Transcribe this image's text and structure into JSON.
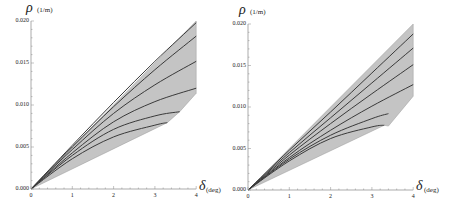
{
  "chart_data": [
    {
      "type": "area",
      "title": "",
      "xlabel": "δ (deg)",
      "ylabel": "ρ (1/m)",
      "x_symbol": "δ",
      "x_unit": "(deg)",
      "y_symbol": "ρ",
      "y_unit": "(1/m)",
      "xlim": [
        0,
        4
      ],
      "ylim": [
        0,
        0.02
      ],
      "xticks": [
        "0",
        "1",
        "2",
        "3",
        "4"
      ],
      "yticks": [
        "0.000",
        "0.005",
        "0.010",
        "0.015",
        "0.020"
      ],
      "grid": false,
      "fill_color": "#c4c4c4",
      "line_color": "#3a3a3a",
      "region_boundary": [
        [
          0,
          0
        ],
        [
          4,
          0.02
        ],
        [
          4,
          0.0114
        ],
        [
          3.6,
          0.0092
        ],
        [
          3.3,
          0.0079
        ],
        [
          0,
          0
        ]
      ],
      "series": [
        {
          "name": "curve-1",
          "x": [
            0,
            1,
            2,
            3,
            4
          ],
          "y": [
            0,
            0.0052,
            0.0103,
            0.0152,
            0.0198
          ]
        },
        {
          "name": "curve-2",
          "x": [
            0,
            1,
            2,
            3,
            4
          ],
          "y": [
            0,
            0.005,
            0.0098,
            0.0142,
            0.0182
          ]
        },
        {
          "name": "curve-3",
          "x": [
            0,
            1,
            2,
            3,
            4
          ],
          "y": [
            0,
            0.0047,
            0.009,
            0.0124,
            0.0152
          ]
        },
        {
          "name": "curve-4",
          "x": [
            0,
            1,
            2,
            3,
            4
          ],
          "y": [
            0,
            0.0043,
            0.008,
            0.0104,
            0.012
          ]
        },
        {
          "name": "curve-5",
          "x": [
            0,
            1,
            2,
            3,
            3.6
          ],
          "y": [
            0,
            0.004,
            0.0071,
            0.0087,
            0.0092
          ]
        },
        {
          "name": "curve-6",
          "x": [
            0,
            1,
            2,
            3,
            3.3
          ],
          "y": [
            0,
            0.0036,
            0.0062,
            0.0076,
            0.0079
          ]
        }
      ]
    },
    {
      "type": "area",
      "title": "",
      "xlabel": "δ (deg)",
      "ylabel": "ρ (1/m)",
      "x_symbol": "δ",
      "x_unit": "(deg)",
      "y_symbol": "ρ",
      "y_unit": "(1/m)",
      "xlim": [
        0,
        4
      ],
      "ylim": [
        0,
        0.02
      ],
      "xticks": [
        "0",
        "1",
        "2",
        "3",
        "4"
      ],
      "yticks": [
        "0.000",
        "0.005",
        "0.010",
        "0.015",
        "0.020"
      ],
      "grid": false,
      "fill_color": "#c4c4c4",
      "line_color": "#3a3a3a",
      "region_boundary": [
        [
          0,
          0
        ],
        [
          4,
          0.02
        ],
        [
          4,
          0.0113
        ],
        [
          3.4,
          0.0077
        ],
        [
          3.3,
          0.0078
        ],
        [
          0,
          0
        ]
      ],
      "series": [
        {
          "name": "curve-1",
          "x": [
            0,
            1,
            2,
            3,
            4
          ],
          "y": [
            0,
            0.0048,
            0.0094,
            0.0141,
            0.0188
          ]
        },
        {
          "name": "curve-2",
          "x": [
            0,
            1,
            2,
            3,
            4
          ],
          "y": [
            0,
            0.0045,
            0.0087,
            0.0129,
            0.0171
          ]
        },
        {
          "name": "curve-3",
          "x": [
            0,
            1,
            2,
            3,
            4
          ],
          "y": [
            0,
            0.0042,
            0.008,
            0.0116,
            0.0151
          ]
        },
        {
          "name": "curve-4",
          "x": [
            0,
            1,
            2,
            3,
            4
          ],
          "y": [
            0,
            0.0039,
            0.0072,
            0.0101,
            0.0127
          ]
        },
        {
          "name": "curve-5",
          "x": [
            0,
            1,
            2,
            3,
            3.4
          ],
          "y": [
            0,
            0.0037,
            0.0066,
            0.0086,
            0.0092
          ]
        },
        {
          "name": "curve-6",
          "x": [
            0,
            1,
            2,
            3,
            3.3
          ],
          "y": [
            0,
            0.0035,
            0.0062,
            0.0076,
            0.0078
          ]
        }
      ]
    }
  ]
}
